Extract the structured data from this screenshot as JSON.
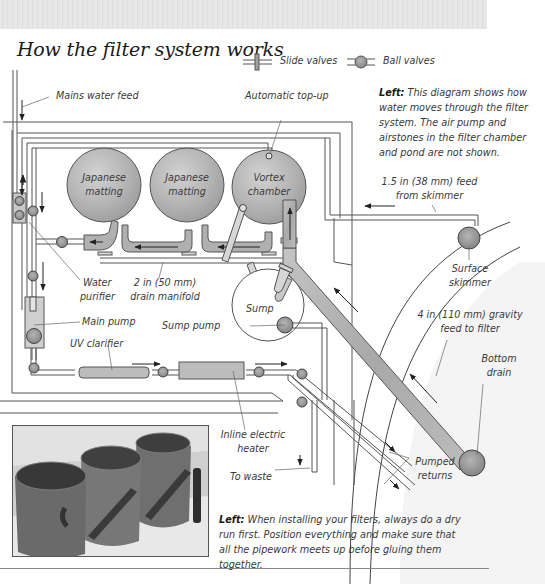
{
  "page": {
    "title": "How the filter system works",
    "legend": {
      "slide_valves": "Slide valves",
      "ball_valves": "Ball valves"
    }
  },
  "diagram": {
    "labels": {
      "mains_water_feed": "Mains water feed",
      "automatic_top_up": "Automatic top-up",
      "tank1": [
        "Japanese",
        "matting"
      ],
      "tank2": [
        "Japanese",
        "matting"
      ],
      "tank3": [
        "Vortex",
        "chamber"
      ],
      "feed_from_skimmer": [
        "1.5 in (38 mm) feed",
        "from skimmer"
      ],
      "surface_skimmer": [
        "Surface",
        "skimmer"
      ],
      "water_purifier": [
        "Water",
        "purifier"
      ],
      "drain_manifold": [
        "2 in (50 mm)",
        "drain manifold"
      ],
      "sump": "Sump",
      "sump_pump": "Sump pump",
      "main_pump": "Main pump",
      "uv_clarifier": "UV clarifier",
      "gravity_feed": [
        "4 in (110 mm) gravity",
        "feed to filter"
      ],
      "bottom_drain": [
        "Bottom",
        "drain"
      ],
      "inline_heater": [
        "Inline electric",
        "heater"
      ],
      "to_waste": "To waste",
      "pumped_returns": [
        "Pumped",
        "returns"
      ]
    },
    "colors": {
      "pipe_fill": "#d9d9d9",
      "pipe_stroke": "#555555",
      "tank_fill": "#b8b8b8",
      "valve_fill": "#9a9a9a",
      "band": "#e4e4e4"
    }
  },
  "captions": {
    "diagram": {
      "lead": "Left:",
      "text": "This diagram shows how water moves through the filter system. The air pump and airstones in the filter chamber and pond are not shown."
    },
    "photo": {
      "lead": "Left:",
      "text": "When installing your filters, always do a dry run first. Position everything and make sure that all the pipework meets up before gluing them together."
    }
  }
}
